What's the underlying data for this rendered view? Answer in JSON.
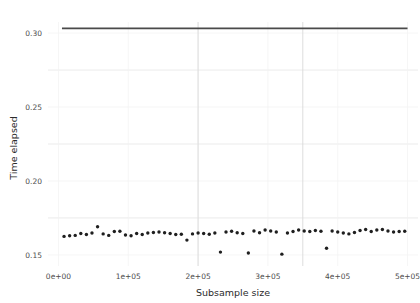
{
  "chart_data": {
    "type": "scatter",
    "title": "",
    "xlabel": "Subsample size",
    "ylabel": "Time elapsed",
    "xlim": [
      -15000,
      515000
    ],
    "ylim": [
      0.1425,
      0.3075
    ],
    "grid": true,
    "legend": null,
    "xticks": [
      0,
      100000,
      200000,
      300000,
      400000,
      500000
    ],
    "xtick_labels": [
      "0e+00",
      "1e+05",
      "2e+05",
      "3e+05",
      "4e+05",
      "5e+05"
    ],
    "yticks": [
      0.15,
      0.2,
      0.25,
      0.3
    ],
    "ytick_labels": [
      "0.15",
      "0.20",
      "0.25",
      "0.30"
    ],
    "y_minor_gridlines": [
      0.175,
      0.225,
      0.275
    ],
    "point_color": "#1f1f1f",
    "line_color": "#4a4a4a",
    "grid_color": "#e6e6e6",
    "series": [
      {
        "name": "points",
        "type": "scatter",
        "x": [
          8000,
          16000,
          24000,
          32000,
          40000,
          48000,
          56000,
          64000,
          72000,
          80000,
          88000,
          96000,
          104000,
          112000,
          120000,
          128000,
          136000,
          144000,
          152000,
          160000,
          168000,
          176000,
          184000,
          192000,
          200000,
          208000,
          216000,
          224000,
          232000,
          240000,
          248000,
          256000,
          264000,
          272000,
          280000,
          288000,
          296000,
          304000,
          312000,
          320000,
          328000,
          336000,
          344000,
          352000,
          360000,
          368000,
          376000,
          384000,
          392000,
          400000,
          408000,
          416000,
          424000,
          432000,
          440000,
          448000,
          456000,
          464000,
          472000,
          480000,
          488000,
          496000
        ],
        "y": [
          0.1625,
          0.163,
          0.1632,
          0.1645,
          0.1638,
          0.1648,
          0.169,
          0.1642,
          0.1632,
          0.1658,
          0.166,
          0.1635,
          0.163,
          0.1645,
          0.1638,
          0.1648,
          0.1652,
          0.1655,
          0.165,
          0.1645,
          0.1638,
          0.164,
          0.16,
          0.1642,
          0.1648,
          0.1645,
          0.164,
          0.1648,
          0.1519,
          0.1655,
          0.166,
          0.165,
          0.1645,
          0.1513,
          0.1662,
          0.165,
          0.1668,
          0.1662,
          0.1655,
          0.1505,
          0.1648,
          0.1658,
          0.1668,
          0.1662,
          0.1658,
          0.1665,
          0.166,
          0.1545,
          0.1662,
          0.1655,
          0.1648,
          0.1642,
          0.1652,
          0.1665,
          0.1672,
          0.1658,
          0.1668,
          0.1672,
          0.1662,
          0.1655,
          0.1658,
          0.166
        ]
      },
      {
        "name": "flat-line",
        "type": "line",
        "x": [
          5000,
          500000
        ],
        "y": [
          0.3032,
          0.3032
        ]
      }
    ]
  }
}
